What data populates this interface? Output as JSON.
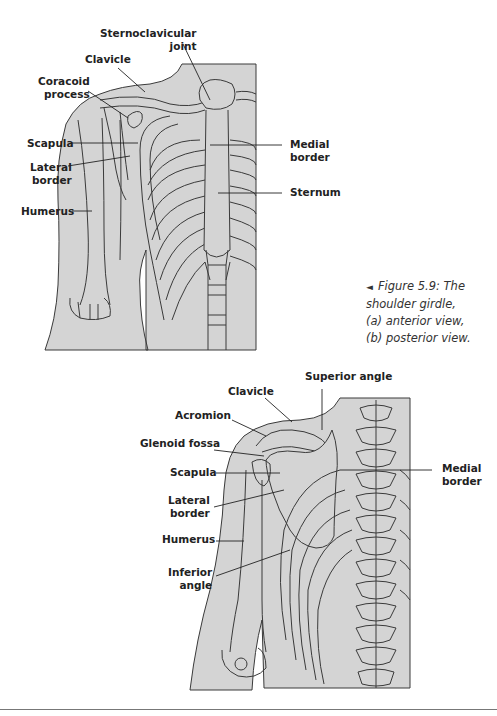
{
  "figure": {
    "number": "Figure 5.9",
    "caption_line1": "Figure 5.9: The",
    "caption_line2": "shoulder girdle,",
    "caption_line3": "(a) anterior view,",
    "caption_line4": "(b) posterior view.",
    "pointer_glyph": "◄"
  },
  "colors": {
    "fill": "#d4d4d4",
    "outline": "#3a3a3a",
    "label": "#222222",
    "background": "#ffffff"
  },
  "anterior_view": {
    "labels": {
      "sternoclavicular": "Sternoclavicular\njoint",
      "clavicle": "Clavicle",
      "coracoid": "Coracoid\nprocess",
      "scapula": "Scapula",
      "lateral_border": "Lateral\nborder",
      "humerus": "Humerus",
      "medial_border": "Medial\nborder",
      "sternum": "Sternum"
    }
  },
  "posterior_view": {
    "labels": {
      "superior_angle": "Superior angle",
      "clavicle": "Clavicle",
      "acromion": "Acromion",
      "glenoid_fossa": "Glenoid fossa",
      "scapula": "Scapula",
      "lateral_border": "Lateral\nborder",
      "humerus": "Humerus",
      "inferior_angle": "Inferior\nangle",
      "medial_border": "Medial\nborder"
    }
  }
}
